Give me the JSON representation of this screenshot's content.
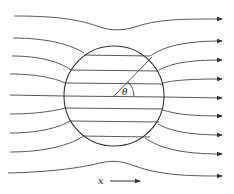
{
  "diagram": {
    "labels": {
      "angle": "θ",
      "axis": "x"
    },
    "colors": {
      "stroke": "#444444",
      "background": "#ffffff"
    },
    "sphere": {
      "cx": 114,
      "cy": 96,
      "r": 50
    },
    "field_line_count": 9
  }
}
